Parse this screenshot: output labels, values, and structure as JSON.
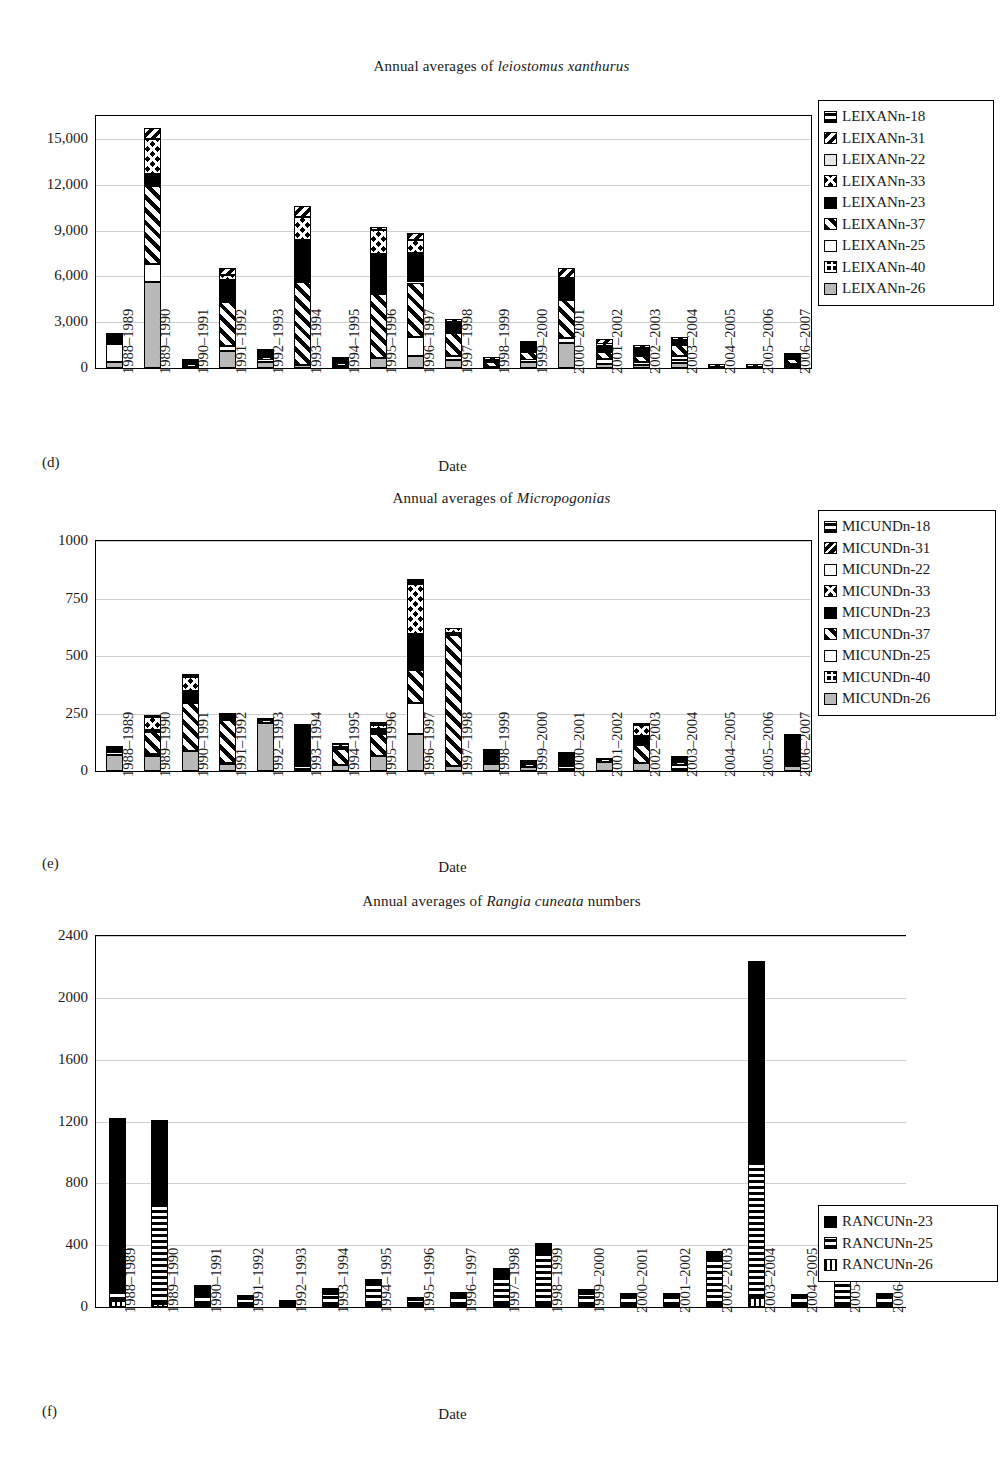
{
  "figure": {
    "panels": [
      "(d)",
      "(e)",
      "(f)"
    ],
    "axis_title": "Date",
    "categories": [
      "1988–1989",
      "1989–1990",
      "1990–1991",
      "1991–1992",
      "1992–1993",
      "1993–1994",
      "1994–1995",
      "1995–1996",
      "1996–1997",
      "1997–1998",
      "1998–1999",
      "1999–2000",
      "2000–2001",
      "2001–2002",
      "2002–2003",
      "2003–2004",
      "2004–2005",
      "2005–2006",
      "2006–2007"
    ]
  },
  "chart_data": [
    {
      "type": "bar",
      "stacked": true,
      "panel": "(d)",
      "title_prefix": "Annual averages of ",
      "title_italic": "leiostomus xanthurus",
      "title": "Annual averages of leiostomus xanthurus",
      "xlabel": "Date",
      "ylabel": "",
      "ylim": [
        0,
        16500
      ],
      "yticks": [
        0,
        3000,
        6000,
        9000,
        12000,
        15000
      ],
      "ytick_labels": [
        "0",
        "3,000",
        "6,000",
        "9,000",
        "12,000",
        "15,000"
      ],
      "grid": true,
      "legend_position": "right",
      "categories": [
        "1988–1989",
        "1989–1990",
        "1990–1991",
        "1991–1992",
        "1992–1993",
        "1993–1994",
        "1994–1995",
        "1995–1996",
        "1996–1997",
        "1997–1998",
        "1998–1999",
        "1999–2000",
        "2000–2001",
        "2001–2002",
        "2002–2003",
        "2003–2004",
        "2004–2005",
        "2005–2006",
        "2006–2007"
      ],
      "series": [
        {
          "name": "LEIXANn-18",
          "pattern": "hbar",
          "values": [
            0,
            0,
            40,
            0,
            0,
            0,
            0,
            0,
            0,
            0,
            0,
            0,
            0,
            0,
            0,
            0,
            0,
            0,
            0
          ]
        },
        {
          "name": "LEIXANn-31",
          "pattern": "diagL",
          "values": [
            0,
            700,
            40,
            450,
            0,
            700,
            0,
            80,
            450,
            240,
            20,
            90,
            650,
            330,
            210,
            180,
            20,
            30,
            80
          ]
        },
        {
          "name": "LEIXANn-22",
          "pattern": "ltgrey",
          "values": [
            0,
            0,
            0,
            0,
            0,
            0,
            0,
            0,
            0,
            0,
            0,
            0,
            0,
            0,
            0,
            0,
            0,
            0,
            0
          ]
        },
        {
          "name": "LEIXANn-33",
          "pattern": "diamond",
          "values": [
            0,
            2300,
            0,
            350,
            0,
            1500,
            150,
            1600,
            900,
            0,
            0,
            60,
            0,
            90,
            130,
            110,
            0,
            0,
            0
          ]
        },
        {
          "name": "LEIXANn-23",
          "pattern": "solid",
          "values": [
            700,
            800,
            130,
            1400,
            500,
            2800,
            200,
            2600,
            1900,
            700,
            150,
            500,
            1400,
            420,
            380,
            250,
            60,
            60,
            250
          ]
        },
        {
          "name": "LEIXANn-37",
          "pattern": "diagR",
          "values": [
            0,
            5100,
            180,
            2900,
            200,
            5400,
            230,
            4200,
            3600,
            1500,
            300,
            550,
            2500,
            480,
            420,
            700,
            30,
            30,
            300
          ]
        },
        {
          "name": "LEIXANn-25",
          "pattern": "white",
          "values": [
            1200,
            1200,
            0,
            350,
            120,
            0,
            0,
            0,
            1200,
            260,
            0,
            120,
            320,
            300,
            180,
            280,
            0,
            0,
            180
          ]
        },
        {
          "name": "LEIXANn-40",
          "pattern": "check",
          "values": [
            0,
            0,
            0,
            0,
            0,
            0,
            0,
            0,
            0,
            0,
            0,
            0,
            0,
            0,
            0,
            150,
            0,
            0,
            0
          ]
        },
        {
          "name": "LEIXANn-26",
          "pattern": "grey",
          "values": [
            400,
            5600,
            80,
            1100,
            400,
            200,
            130,
            650,
            800,
            530,
            80,
            400,
            1650,
            260,
            190,
            360,
            0,
            0,
            100
          ]
        }
      ],
      "totals": [
        2300,
        15700,
        470,
        6550,
        1220,
        10600,
        710,
        9130,
        8850,
        3230,
        550,
        1720,
        6520,
        1880,
        1510,
        2030,
        110,
        120,
        910
      ]
    },
    {
      "type": "bar",
      "stacked": true,
      "panel": "(e)",
      "title_prefix": "Annual averages of ",
      "title_italic": "Micropogonias",
      "title": "Annual averages of Micropogonias",
      "xlabel": "Date",
      "ylabel": "",
      "ylim": [
        0,
        1000
      ],
      "yticks": [
        0,
        250,
        500,
        750,
        1000
      ],
      "ytick_labels": [
        "0",
        "250",
        "500",
        "750",
        "1000"
      ],
      "grid": true,
      "legend_position": "right",
      "categories": [
        "1988–1989",
        "1989–1990",
        "1990–1991",
        "1991–1992",
        "1992–1993",
        "1993–1994",
        "1994–1995",
        "1995–1996",
        "1996–1997",
        "1997–1998",
        "1998–1999",
        "1999–2000",
        "2000–2001",
        "2001–2002",
        "2002–2003",
        "2003–2004",
        "2004–2005",
        "2005–2006",
        "2006–2007"
      ],
      "series": [
        {
          "name": "MICUNDn-18",
          "pattern": "hbar",
          "values": [
            8,
            10,
            12,
            10,
            0,
            0,
            6,
            8,
            18,
            0,
            10,
            0,
            4,
            0,
            5,
            5,
            0,
            0,
            12
          ]
        },
        {
          "name": "MICUNDn-31",
          "pattern": "diagL2",
          "values": [
            0,
            0,
            0,
            0,
            0,
            0,
            0,
            0,
            0,
            0,
            0,
            0,
            0,
            0,
            0,
            12,
            0,
            0,
            0
          ]
        },
        {
          "name": "MICUNDn-22",
          "pattern": "white",
          "values": [
            0,
            0,
            0,
            0,
            0,
            0,
            0,
            0,
            0,
            0,
            0,
            0,
            0,
            0,
            0,
            0,
            0,
            0,
            0
          ]
        },
        {
          "name": "MICUNDn-33",
          "pattern": "diamond",
          "values": [
            0,
            55,
            60,
            10,
            0,
            0,
            8,
            20,
            220,
            18,
            0,
            0,
            0,
            0,
            45,
            0,
            0,
            0,
            0
          ]
        },
        {
          "name": "MICUNDn-23",
          "pattern": "solid",
          "values": [
            20,
            8,
            55,
            12,
            8,
            185,
            10,
            22,
            155,
            10,
            48,
            25,
            40,
            10,
            40,
            6,
            0,
            0,
            130
          ]
        },
        {
          "name": "MICUNDn-37",
          "pattern": "diagR",
          "values": [
            0,
            95,
            210,
            185,
            8,
            0,
            70,
            95,
            145,
            570,
            8,
            6,
            10,
            6,
            78,
            8,
            0,
            0,
            0
          ]
        },
        {
          "name": "MICUNDn-25",
          "pattern": "white",
          "values": [
            8,
            10,
            0,
            6,
            0,
            8,
            0,
            0,
            135,
            0,
            0,
            0,
            10,
            0,
            0,
            18,
            0,
            0,
            0
          ]
        },
        {
          "name": "MICUNDn-40",
          "pattern": "check",
          "values": [
            0,
            0,
            0,
            0,
            0,
            0,
            0,
            0,
            0,
            0,
            0,
            0,
            0,
            0,
            0,
            0,
            0,
            0,
            0
          ]
        },
        {
          "name": "MICUNDn-26",
          "pattern": "grey",
          "values": [
            70,
            65,
            85,
            30,
            210,
            10,
            25,
            65,
            160,
            22,
            30,
            18,
            10,
            40,
            35,
            10,
            0,
            0,
            20
          ]
        }
      ],
      "totals": [
        106,
        243,
        422,
        253,
        226,
        203,
        119,
        210,
        833,
        620,
        96,
        49,
        74,
        56,
        203,
        59,
        0,
        0,
        162
      ]
    },
    {
      "type": "bar",
      "stacked": true,
      "panel": "(f)",
      "title_prefix": "Annual averages of ",
      "title_italic": "Rangia cuneata",
      "title_suffix": " numbers",
      "title": "Annual averages of Rangia cuneata numbers",
      "xlabel": "Date",
      "ylabel": "",
      "ylim": [
        0,
        2400
      ],
      "yticks": [
        0,
        400,
        800,
        1200,
        1600,
        2000,
        2400
      ],
      "ytick_labels": [
        "0",
        "400",
        "800",
        "1200",
        "1600",
        "2000",
        "2400"
      ],
      "grid": true,
      "legend_position": "right",
      "categories": [
        "1988–1989",
        "1989–1990",
        "1990–1991",
        "1991–1992",
        "1992–1993",
        "1993–1994",
        "1994–1995",
        "1995–1996",
        "1996–1997",
        "1997–1998",
        "1998–1999",
        "1999–2000",
        "2000–2001",
        "2001–2002",
        "2002–2003",
        "2003–2004",
        "2004–2005",
        "2005–2006",
        "2006–2007"
      ],
      "series": [
        {
          "name": "RANCUNn-23",
          "pattern": "solid",
          "values": [
            1130,
            550,
            55,
            20,
            10,
            35,
            30,
            20,
            25,
            55,
            80,
            30,
            25,
            15,
            60,
            1310,
            20,
            30,
            25
          ]
        },
        {
          "name": "RANCUNn-25",
          "pattern": "hbar",
          "values": [
            55,
            640,
            70,
            50,
            25,
            80,
            140,
            40,
            70,
            190,
            320,
            80,
            60,
            70,
            290,
            870,
            60,
            215,
            60
          ]
        },
        {
          "name": "RANCUNn-26",
          "pattern": "vbar",
          "values": [
            40,
            20,
            15,
            5,
            5,
            5,
            10,
            5,
            5,
            10,
            15,
            5,
            5,
            5,
            10,
            60,
            5,
            5,
            5
          ]
        }
      ],
      "totals": [
        1225,
        1210,
        140,
        75,
        40,
        120,
        180,
        65,
        100,
        255,
        415,
        115,
        90,
        90,
        360,
        2240,
        85,
        250,
        90
      ]
    }
  ]
}
